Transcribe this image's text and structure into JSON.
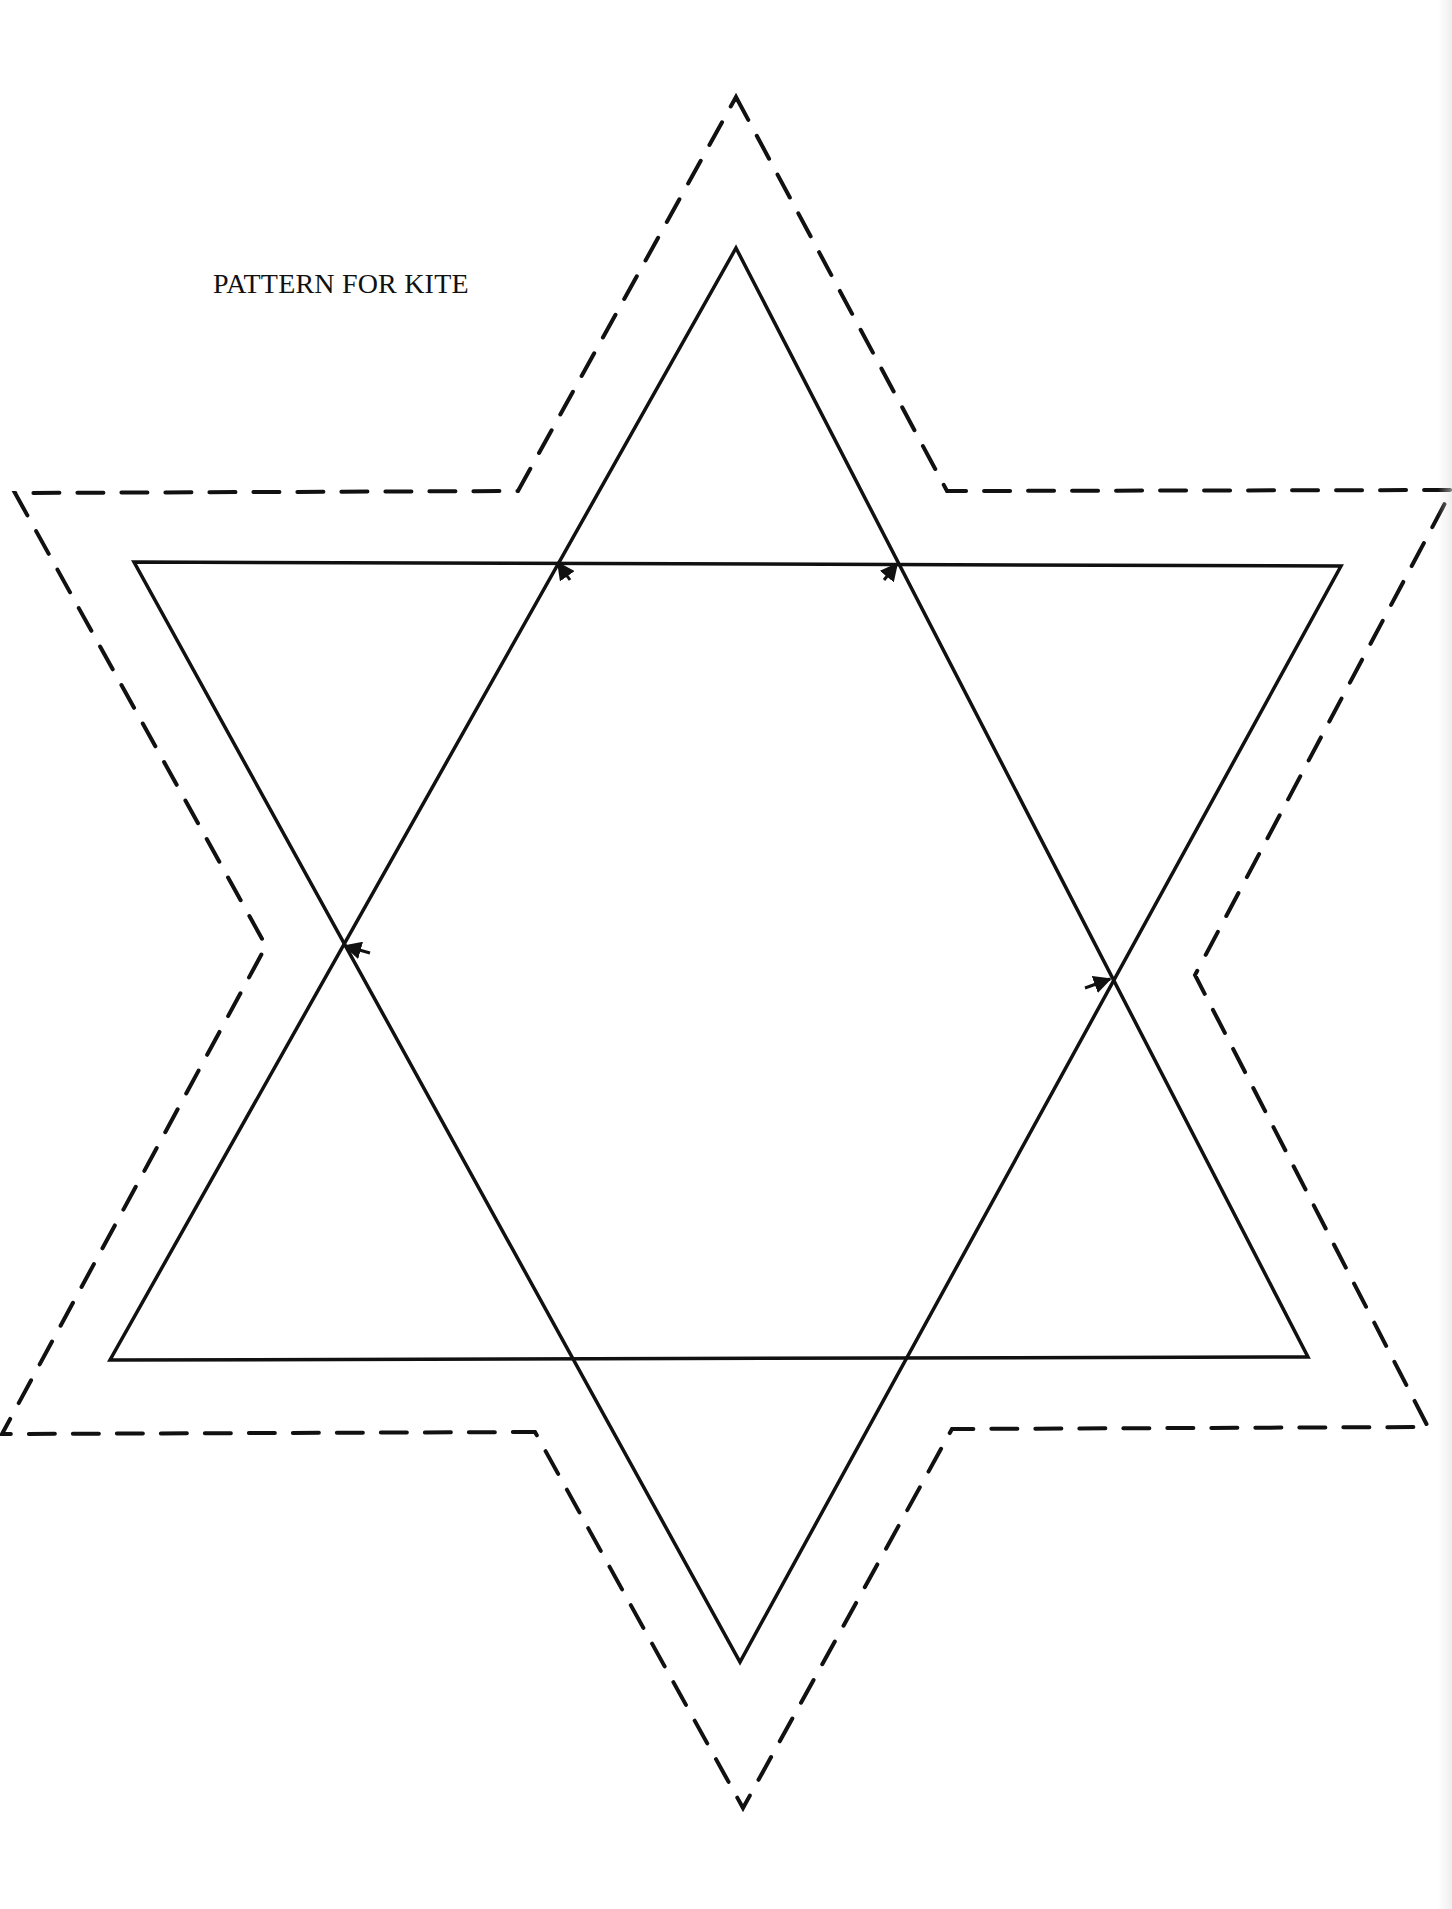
{
  "page": {
    "title": "PATTERN FOR KITE",
    "background": "#ffffff",
    "ink_color": "#111111"
  },
  "diagram": {
    "type": "hexagram-kite-pattern",
    "outer_cut_line": {
      "style": "dashed",
      "points": [
        [
          736,
          97
        ],
        [
          947,
          491
        ],
        [
          1452,
          490
        ],
        [
          1195,
          975
        ],
        [
          1428,
          1427
        ],
        [
          952,
          1429
        ],
        [
          743,
          1808
        ],
        [
          535,
          1432
        ],
        [
          2,
          1434
        ],
        [
          266,
          946
        ],
        [
          15,
          493
        ],
        [
          518,
          491
        ]
      ]
    },
    "upward_triangle": {
      "style": "solid",
      "points": [
        [
          736,
          248
        ],
        [
          1308,
          1357
        ],
        [
          110,
          1360
        ]
      ]
    },
    "downward_triangle": {
      "style": "solid",
      "points": [
        [
          134,
          562
        ],
        [
          1341,
          566
        ],
        [
          740,
          1662
        ]
      ]
    },
    "arrows": [
      {
        "at": [
          558,
          563
        ],
        "from": [
          570,
          580
        ],
        "label": "arrow-top-left"
      },
      {
        "at": [
          897,
          564
        ],
        "from": [
          884,
          580
        ],
        "label": "arrow-top-right"
      },
      {
        "at": [
          345,
          946
        ],
        "from": [
          370,
          953
        ],
        "label": "arrow-left"
      },
      {
        "at": [
          1110,
          979
        ],
        "from": [
          1085,
          988
        ],
        "label": "arrow-right"
      }
    ]
  }
}
